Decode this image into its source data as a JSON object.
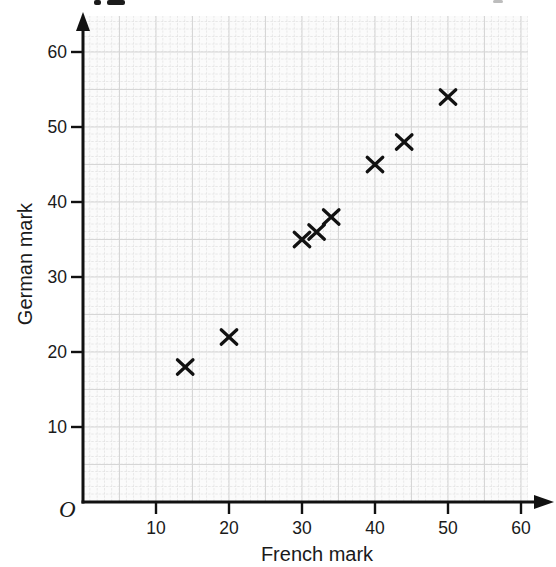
{
  "figure": {
    "origin_label": "O"
  },
  "chart_data": {
    "type": "scatter",
    "title": "",
    "xlabel": "French mark",
    "ylabel": "German mark",
    "xlim": [
      0,
      63
    ],
    "ylim": [
      0,
      65
    ],
    "x_ticks": [
      10,
      20,
      30,
      40,
      50,
      60
    ],
    "y_ticks": [
      10,
      20,
      30,
      40,
      50,
      60
    ],
    "marker": "x",
    "grid": "graph-paper: fine dotted 1-unit cells with light major lines every 5 units",
    "legend": "none",
    "points": [
      {
        "x": 14,
        "y": 18
      },
      {
        "x": 20,
        "y": 22
      },
      {
        "x": 30,
        "y": 35
      },
      {
        "x": 32,
        "y": 36
      },
      {
        "x": 34,
        "y": 38
      },
      {
        "x": 40,
        "y": 45
      },
      {
        "x": 44,
        "y": 48
      },
      {
        "x": 50,
        "y": 54
      }
    ],
    "colors": {
      "marker": "#111111",
      "axis": "#111111",
      "tick_text": "#1a1a1a",
      "major_grid": "#d6d6d6",
      "minor_grid": "#e4e4e4",
      "plot_bg": "#fbfbfb"
    }
  }
}
